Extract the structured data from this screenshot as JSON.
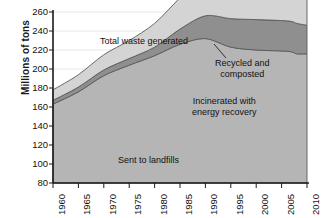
{
  "chart_data": {
    "type": "area",
    "stacked": true,
    "title": "",
    "xlabel": "",
    "ylabel": "Millions of tons",
    "xlim": [
      1960,
      2010
    ],
    "ylim": [
      80,
      260
    ],
    "xticks": [
      1960,
      1965,
      1970,
      1975,
      1980,
      1985,
      1990,
      1995,
      2000,
      2005,
      2010
    ],
    "yticks": [
      80,
      100,
      120,
      140,
      160,
      180,
      200,
      220,
      240,
      260
    ],
    "grid": "horizontal",
    "legend": "inline-annotations",
    "x": [
      1960,
      1965,
      1970,
      1975,
      1980,
      1985,
      1990,
      1995,
      2000,
      2005,
      2007,
      2008,
      2010
    ],
    "series": [
      {
        "name": "Sent to landfills",
        "color": "#b5b5b5",
        "values": [
          83,
          96,
          113,
          124,
          134,
          146,
          152,
          143,
          140,
          139,
          138,
          136,
          136
        ]
      },
      {
        "name": "Incinerated with energy recovery",
        "color": "#8f8f8f",
        "values": [
          4,
          5,
          6,
          7,
          9,
          16,
          24,
          30,
          32,
          32,
          32,
          32,
          30
        ]
      },
      {
        "name": "Recycled and composted",
        "color": "#d4d4d4",
        "values": [
          11,
          13,
          16,
          19,
          25,
          33,
          44,
          55,
          70,
          80,
          84,
          75,
          83
        ]
      }
    ],
    "totals": {
      "name": "Total waste generated",
      "values": [
        98,
        114,
        135,
        150,
        168,
        195,
        220,
        228,
        242,
        251,
        254,
        243,
        249
      ]
    },
    "annotations": [
      {
        "id": "total-waste",
        "text": "Total waste generated",
        "leader": true
      },
      {
        "id": "recycled",
        "line1": "Recycled and",
        "line2": "composted"
      },
      {
        "id": "incinerated",
        "line1": "Incinerated with",
        "line2": "energy recovery"
      },
      {
        "id": "landfills",
        "text": "Sent to landfills"
      }
    ]
  },
  "axes": {
    "y_title": "Millions of tons",
    "y_labels": [
      "260",
      "240",
      "220",
      "200",
      "180",
      "160",
      "140",
      "120",
      "100",
      "80"
    ],
    "x_labels": [
      "1960",
      "1965",
      "1970",
      "1975",
      "1980",
      "1985",
      "1990",
      "1995",
      "2000",
      "2005",
      "2010"
    ]
  },
  "annotations": {
    "total_waste": "Total waste generated",
    "recycled_l1": "Recycled and",
    "recycled_l2": "composted",
    "incinerated_l1": "Incinerated with",
    "incinerated_l2": "energy recovery",
    "landfills": "Sent to landfills"
  },
  "colors": {
    "recycled": "#d4d4d4",
    "incinerated": "#8f8f8f",
    "landfill": "#b5b5b5",
    "axis": "#1a1a1a",
    "grid": "#e8e8e8",
    "text": "#111111"
  }
}
